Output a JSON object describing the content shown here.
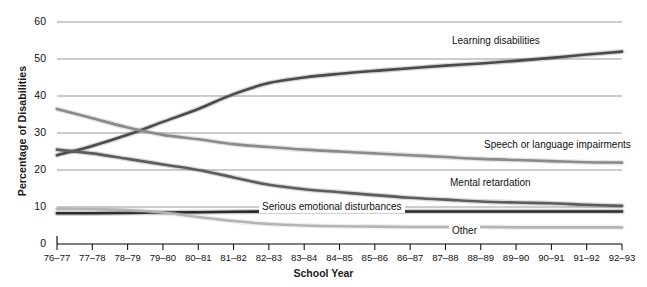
{
  "chart_data": {
    "type": "line",
    "title": "",
    "xlabel": "School Year",
    "ylabel": "Percentage of Disabilities",
    "ylim": [
      0,
      60
    ],
    "yticks": [
      0,
      10,
      20,
      30,
      40,
      50,
      60
    ],
    "ytick_labels": [
      "0",
      "10",
      "20",
      "30",
      "40",
      "50",
      "60"
    ],
    "grid": true,
    "legend_position": "inline-labels",
    "categories": [
      "76–77",
      "77–78",
      "78–79",
      "79–80",
      "80–81",
      "81–82",
      "82–83",
      "83–84",
      "84–85",
      "85–86",
      "86–87",
      "87–88",
      "88–89",
      "89–90",
      "90–91",
      "91–92",
      "92–93"
    ],
    "series": [
      {
        "name": "Learning disabilities",
        "color": "#4a4a4a",
        "label_x": 449,
        "label_y": 41,
        "values": [
          24.0,
          26.5,
          29.5,
          33.0,
          36.5,
          40.5,
          43.5,
          45.0,
          46.0,
          46.8,
          47.5,
          48.2,
          48.8,
          49.5,
          50.3,
          51.2,
          52.0
        ]
      },
      {
        "name": "Speech or language impairments",
        "color": "#8a8a8a",
        "label_x": 481,
        "label_y": 145,
        "values": [
          36.5,
          34.0,
          31.5,
          29.5,
          28.3,
          27.0,
          26.2,
          25.5,
          25.0,
          24.5,
          24.0,
          23.5,
          23.0,
          22.7,
          22.4,
          22.1,
          22.0
        ]
      },
      {
        "name": "Mental retardation",
        "color": "#5c5c5c",
        "label_x": 447,
        "label_y": 183,
        "values": [
          25.5,
          24.5,
          23.0,
          21.5,
          20.0,
          18.0,
          16.0,
          14.8,
          14.0,
          13.2,
          12.5,
          12.0,
          11.5,
          11.2,
          11.0,
          10.6,
          10.3
        ]
      },
      {
        "name": "Serious emotional disturbances",
        "color": "#2b2b2b",
        "label_x": 259,
        "label_y": 207,
        "values": [
          8.3,
          8.3,
          8.4,
          8.5,
          8.6,
          8.7,
          8.8,
          8.8,
          8.8,
          8.8,
          8.8,
          8.8,
          8.8,
          8.8,
          8.8,
          8.8,
          8.8
        ]
      },
      {
        "name": "Other",
        "color": "#b4b4b4",
        "label_x": 449,
        "label_y": 231,
        "values": [
          9.5,
          9.4,
          9.2,
          8.5,
          7.3,
          6.2,
          5.4,
          5.0,
          4.8,
          4.7,
          4.6,
          4.6,
          4.6,
          4.5,
          4.5,
          4.5,
          4.5
        ]
      }
    ]
  },
  "axes": {
    "y_title": "Percentage of Disabilities",
    "x_title": "School Year"
  }
}
